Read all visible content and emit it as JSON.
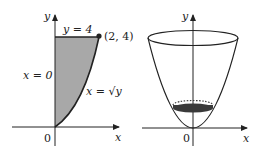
{
  "left_graph": {
    "y_axis_label": "y",
    "x_axis_label": "x",
    "origin_label": "0",
    "top_line_label": "y = 4",
    "point_label": "(2, 4)",
    "left_boundary_label": "x = 0",
    "curve_label": "x = √y",
    "shaded_region": "region bounded by x = 0, y = 4, x = √y",
    "shade_color": "#a8a8a8"
  },
  "right_graph": {
    "y_axis_label": "y",
    "x_axis_label": "x",
    "origin_label": "0",
    "solid": "paraboloid bowl (y = x² rotated about y-axis)",
    "disk_color": "#3a3a3a"
  }
}
